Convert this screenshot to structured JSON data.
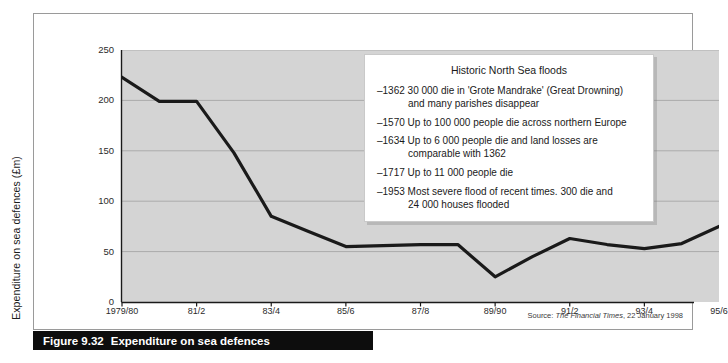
{
  "figure": {
    "caption_number": "Figure 9.32",
    "caption_text": "Expenditure on sea defences",
    "source_prefix": "Source:",
    "source_publication": "The Financial Times",
    "source_date": ", 22 January 1998"
  },
  "callout": {
    "title": "Historic North Sea floods",
    "items": [
      "–1362 30 000 die in 'Grote Mandrake' (Great Drowning)\nand many parishes disappear",
      "–1570 Up to 100 000 people die across northern Europe",
      "–1634 Up to 6 000 people die and land losses are\ncomparable with 1362",
      "–1717 Up to 11 000 people die",
      "–1953 Most severe flood of recent times. 300 die and\n24 000 houses flooded"
    ]
  },
  "chart_data": {
    "type": "line",
    "title": "Expenditure on sea defences",
    "xlabel": "",
    "ylabel": "Expenditure on sea defences (£m)",
    "ylim": [
      0,
      250
    ],
    "yticks": [
      0,
      50,
      100,
      150,
      200,
      250
    ],
    "ytick_labels": [
      "0",
      "50",
      "100",
      "150",
      "200",
      "250"
    ],
    "xtick_labels": [
      "1979/80",
      "81/2",
      "83/4",
      "85/6",
      "87/8",
      "89/90",
      "91/2",
      "93/4",
      "95/6"
    ],
    "grid": true,
    "legend": "none",
    "plot_background": "#d4d4d4",
    "line_color": "#1a1a1a",
    "x": [
      "1979/80",
      "80/1",
      "81/2",
      "82/3",
      "83/4",
      "84/5",
      "85/6",
      "86/7",
      "87/8",
      "88/9",
      "89/90",
      "90/1",
      "91/2",
      "92/3",
      "93/4",
      "94/5",
      "95/6"
    ],
    "values": [
      223,
      199,
      199,
      148,
      85,
      70,
      55,
      56,
      57,
      57,
      25,
      45,
      63,
      57,
      53,
      58,
      75
    ],
    "series": [
      {
        "name": "Expenditure on sea defences (£m)",
        "values": [
          223,
          199,
          199,
          148,
          85,
          70,
          55,
          56,
          57,
          57,
          25,
          45,
          63,
          57,
          53,
          58,
          75
        ]
      }
    ]
  }
}
